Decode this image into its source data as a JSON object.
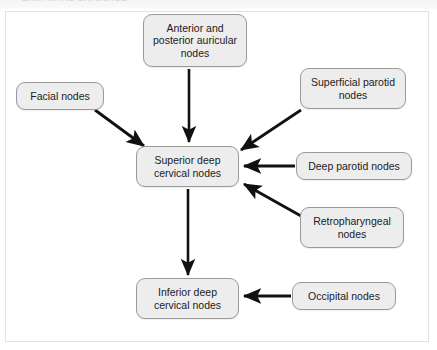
{
  "page": {
    "top_caption": "LYMPHATIC DRAINAGE",
    "background_color": "#ffffff",
    "frame_color": "#e2e2e2"
  },
  "diagram": {
    "type": "flowchart",
    "node_fill_color": "#ededed",
    "node_border_color": "#9a9a9a",
    "arrow_color": "#111111",
    "nodes": [
      {
        "id": "anterior_posterior_auricular",
        "label": "Anterior and\nposterior auricular\nnodes",
        "x": 143,
        "y": 14,
        "w": 104,
        "h": 53
      },
      {
        "id": "facial",
        "label": "Facial nodes",
        "x": 16,
        "y": 82,
        "w": 88,
        "h": 28
      },
      {
        "id": "superficial_parotid",
        "label": "Superficial parotid\nnodes",
        "x": 300,
        "y": 68,
        "w": 106,
        "h": 41
      },
      {
        "id": "superior_deep_cervical",
        "label": "Superior deep\ncervical nodes",
        "x": 136,
        "y": 146,
        "w": 103,
        "h": 41
      },
      {
        "id": "deep_parotid",
        "label": "Deep parotid nodes",
        "x": 296,
        "y": 152,
        "w": 116,
        "h": 28
      },
      {
        "id": "retropharyngeal",
        "label": "Retropharyngeal\nnodes",
        "x": 300,
        "y": 207,
        "w": 104,
        "h": 41
      },
      {
        "id": "inferior_deep_cervical",
        "label": "Inferior deep\ncervical nodes",
        "x": 136,
        "y": 278,
        "w": 103,
        "h": 41
      },
      {
        "id": "occipital",
        "label": "Occipital nodes",
        "x": 292,
        "y": 282,
        "w": 104,
        "h": 28
      }
    ],
    "edges": [
      {
        "from": "anterior_posterior_auricular",
        "to": "superior_deep_cervical",
        "direction": "down"
      },
      {
        "from": "facial",
        "to": "superior_deep_cervical",
        "direction": "down-right"
      },
      {
        "from": "superficial_parotid",
        "to": "superior_deep_cervical",
        "direction": "down-left"
      },
      {
        "from": "deep_parotid",
        "to": "superior_deep_cervical",
        "direction": "left"
      },
      {
        "from": "retropharyngeal",
        "to": "superior_deep_cervical",
        "direction": "up-left"
      },
      {
        "from": "superior_deep_cervical",
        "to": "inferior_deep_cervical",
        "direction": "down"
      },
      {
        "from": "occipital",
        "to": "inferior_deep_cervical",
        "direction": "left"
      }
    ]
  }
}
